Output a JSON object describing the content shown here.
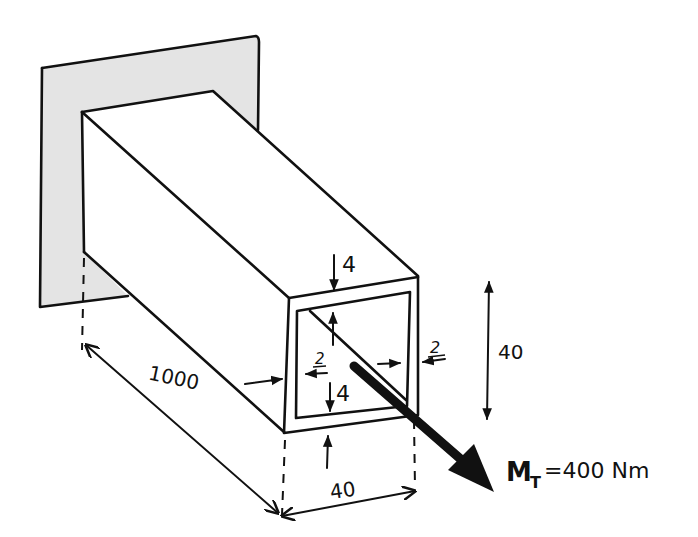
{
  "diagram": {
    "colors": {
      "ink": "#111111",
      "wall_fill": "#e4e4e4",
      "background": "#ffffff"
    },
    "labels": {
      "length": "1000",
      "width": "40",
      "height": "40",
      "wall_top": "4",
      "wall_bottom": "4",
      "wall_left": "2",
      "wall_right": "2",
      "moment_symbol": "M",
      "moment_subscript": "T",
      "moment_value": "=400 Nm"
    }
  }
}
